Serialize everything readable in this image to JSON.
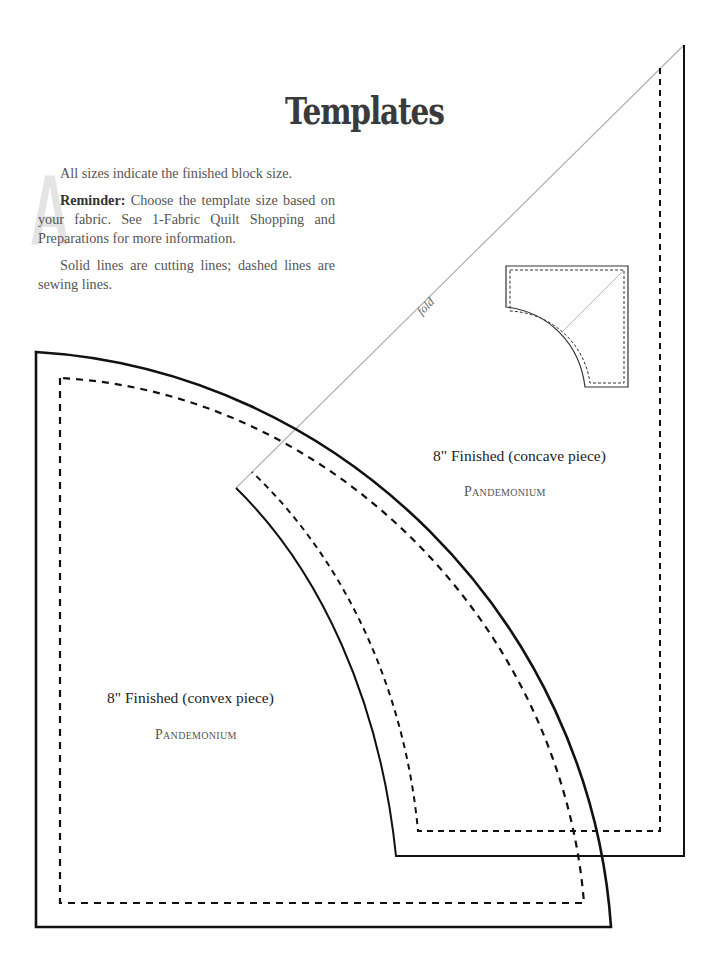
{
  "page": {
    "title": "Templates",
    "dropcap": "A",
    "intro": {
      "line1": "All sizes indicate the finished block size.",
      "reminder_label": "Reminder:",
      "reminder_text": " Choose the template size based on your fabric. See 1-Fabric Quilt Shopping and Preparations for more information.",
      "lines_note": "Solid lines are cutting lines; dashed lines are sewing lines."
    }
  },
  "templates": {
    "fold_label": "fold",
    "concave": {
      "label": "8\" Finished (concave piece)",
      "name": "Pandemonium"
    },
    "convex": {
      "label": "8\" Finished (convex piece)",
      "name": "Pandemonium"
    }
  },
  "colors": {
    "cut_line": "#111111",
    "sew_line": "#111111",
    "fold_line": "#b0b0b0",
    "title": "#3a3a3a",
    "dropcap": "#e4e4e4"
  }
}
